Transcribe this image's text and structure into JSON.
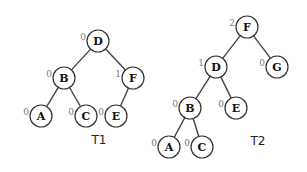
{
  "trees": [
    {
      "name": "T1",
      "label_pos": [
        99,
        140
      ],
      "nodes": [
        {
          "id": "D",
          "label": "D",
          "balance": "0",
          "x": 98,
          "y": 41
        },
        {
          "id": "B",
          "label": "B",
          "balance": "0",
          "x": 64,
          "y": 78
        },
        {
          "id": "F",
          "label": "F",
          "balance": "1",
          "x": 133,
          "y": 78
        },
        {
          "id": "A",
          "label": "A",
          "balance": "0",
          "x": 41,
          "y": 116
        },
        {
          "id": "C",
          "label": "C",
          "balance": "0",
          "x": 86,
          "y": 116
        },
        {
          "id": "E",
          "label": "E",
          "balance": "0",
          "x": 116,
          "y": 116
        }
      ],
      "edges": [
        [
          "D",
          "B"
        ],
        [
          "D",
          "F"
        ],
        [
          "B",
          "A"
        ],
        [
          "B",
          "C"
        ],
        [
          "F",
          "E"
        ]
      ]
    },
    {
      "name": "T2",
      "label_pos": [
        258,
        141
      ],
      "nodes": [
        {
          "id": "F",
          "label": "F",
          "balance": "2",
          "x": 247,
          "y": 27
        },
        {
          "id": "D",
          "label": "D",
          "balance": "1",
          "x": 216,
          "y": 67
        },
        {
          "id": "G",
          "label": "G",
          "balance": "0",
          "x": 277,
          "y": 67
        },
        {
          "id": "B",
          "label": "B",
          "balance": "0",
          "x": 190,
          "y": 108
        },
        {
          "id": "E",
          "label": "E",
          "balance": "0",
          "x": 236,
          "y": 108
        },
        {
          "id": "A",
          "label": "A",
          "balance": "0",
          "x": 169,
          "y": 147
        },
        {
          "id": "C",
          "label": "C",
          "balance": "0",
          "x": 202,
          "y": 147
        }
      ],
      "edges": [
        [
          "F",
          "D"
        ],
        [
          "F",
          "G"
        ],
        [
          "D",
          "B"
        ],
        [
          "D",
          "E"
        ],
        [
          "B",
          "A"
        ],
        [
          "B",
          "C"
        ]
      ]
    }
  ]
}
